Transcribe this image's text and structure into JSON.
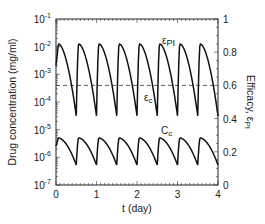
{
  "chart_data": {
    "type": "line",
    "title": "",
    "xlabel": "t (day)",
    "ylabel": "Drug concentration (mg/ml)",
    "ylabel_right": "Efficacy, εPI",
    "xlim": [
      0,
      4
    ],
    "ylim": [
      1e-07,
      0.1
    ],
    "ylim_right": [
      0,
      1
    ],
    "yscale": "log",
    "x_ticks": [
      "0",
      "1",
      "2",
      "3",
      "4"
    ],
    "y_ticks": [
      {
        "base": "10",
        "exp": "-7"
      },
      {
        "base": "10",
        "exp": "-6"
      },
      {
        "base": "10",
        "exp": "-5"
      },
      {
        "base": "10",
        "exp": "-4"
      },
      {
        "base": "10",
        "exp": "-3"
      },
      {
        "base": "10",
        "exp": "-2"
      },
      {
        "base": "10",
        "exp": "-1"
      }
    ],
    "y_ticks_right": [
      "0",
      "0.2",
      "0.4",
      "0.6",
      "0.8",
      "1"
    ],
    "grid": false,
    "dosing_interval_day": 0.5,
    "series": [
      {
        "name": "εPI",
        "label_main": "ε",
        "label_sub": "PI",
        "axis": "right",
        "description": "Efficacy, periodic with dosing every 0.5 day",
        "peak_value": 0.87,
        "trough_value": 0.42,
        "log_peak": -1.9,
        "log_trough": -4.5
      },
      {
        "name": "εc",
        "label_main": "ε",
        "label_sub": "c",
        "axis": "right",
        "style": "dashed",
        "value": 0.6
      },
      {
        "name": "Cc",
        "label_main": "C",
        "label_sub": "c",
        "axis": "left",
        "description": "Drug concentration (mg/ml), periodic with dosing every 0.5 day",
        "peak_value": 5e-06,
        "trough_value": 5.5e-07,
        "log_peak": -5.3,
        "log_trough": -6.28
      }
    ]
  }
}
